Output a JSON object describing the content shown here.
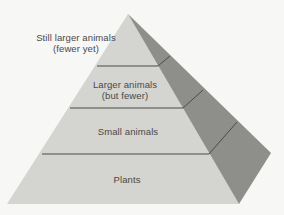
{
  "diagram": {
    "type": "ecological-pyramid",
    "colors": {
      "background": "#f7f7f5",
      "front_face": "#d4d4d0",
      "side_face": "#8e8e8a",
      "divider": "#4a4a48",
      "text": "#4a4a48"
    },
    "levels": [
      {
        "line1": "Still larger animals",
        "line2": "(fewer yet)"
      },
      {
        "line1": "Larger animals",
        "line2": "(but fewer)"
      },
      {
        "line1": "Small animals",
        "line2": ""
      },
      {
        "line1": "Plants",
        "line2": ""
      }
    ]
  }
}
